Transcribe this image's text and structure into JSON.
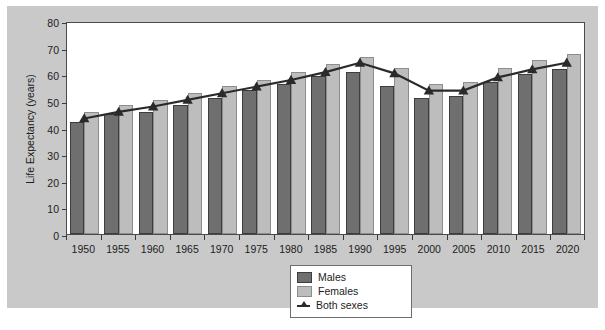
{
  "chart_data": {
    "type": "bar",
    "title": "",
    "xlabel": "",
    "ylabel": "Life Expectancy (years)",
    "ylim": [
      0,
      80
    ],
    "yticks": [
      0,
      10,
      20,
      30,
      40,
      50,
      60,
      70,
      80
    ],
    "grid": false,
    "legend_position": "bottom-center",
    "categories": [
      "1950",
      "1955",
      "1960",
      "1965",
      "1970",
      "1975",
      "1980",
      "1985",
      "1990",
      "1995",
      "2000",
      "2005",
      "2010",
      "2015",
      "2020"
    ],
    "series": [
      {
        "name": "Males",
        "type": "bar",
        "color": "#6f6f6f",
        "values": [
          42,
          45,
          46,
          48.5,
          51,
          54,
          56.5,
          59.5,
          61,
          55.5,
          51,
          52,
          57,
          60,
          62
        ]
      },
      {
        "name": "Females",
        "type": "bar",
        "color": "#bdbdbd",
        "values": [
          46,
          48.5,
          50.5,
          53,
          55.5,
          58,
          61,
          64,
          66.5,
          62.5,
          56.5,
          57,
          62.5,
          65.5,
          67.5
        ]
      },
      {
        "name": "Both sexes",
        "type": "line",
        "color": "#2a2a2a",
        "marker": "triangle",
        "values": [
          44,
          46.5,
          48.5,
          51,
          53.5,
          56,
          58.5,
          61.5,
          65,
          61,
          54.5,
          54.5,
          59.5,
          62.5,
          65
        ]
      }
    ]
  },
  "legend": {
    "items": [
      {
        "label": "Males",
        "swatch": "males"
      },
      {
        "label": "Females",
        "swatch": "females"
      },
      {
        "label": "Both sexes",
        "swatch": "line"
      }
    ]
  },
  "caption": {
    "text": ""
  }
}
